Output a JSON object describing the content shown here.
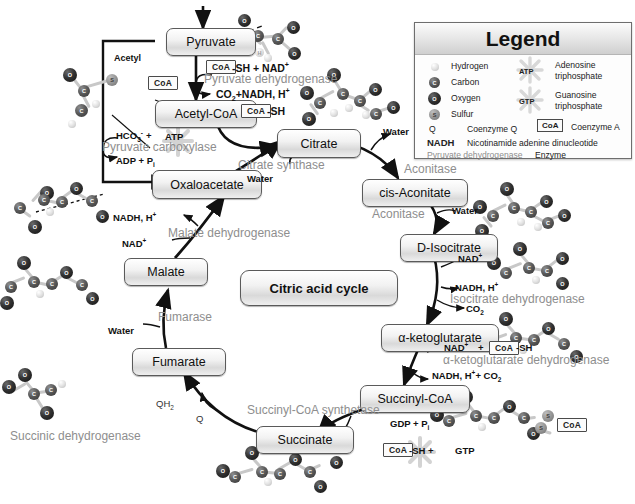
{
  "center_label": "Citric acid cycle",
  "nodes": {
    "pyruvate": "Pyruvate",
    "acetyl_coa": "Acetyl-CoA",
    "oxaloacetate": "Oxaloacetate",
    "citrate": "Citrate",
    "cis_aconitate": "cis-Aconitate",
    "d_isocitrate": "D-Isocitrate",
    "alpha_ketoglutarate": "α-ketoglutarate",
    "succinyl_coa": "Succinyl-CoA",
    "succinate": "Succinate",
    "fumarate": "Fumarate",
    "malate": "Malate"
  },
  "enzymes": {
    "pyruvate_dehydrogenase": "Pyruvate dehydrogenase",
    "pyruvate_carboxylase": "Pyruvate carboxylase",
    "citrate_synthase": "Citrate synthase",
    "aconitase_1": "Aconitase",
    "aconitase_2": "Aconitase",
    "isocitrate_dehydrogenase": "Isocitrate dehydrogenase",
    "akg_dehydrogenase": "α-ketoglutarate dehydrogenase",
    "succinyl_coa_synthetase": "Succinyl-CoA synthetase",
    "succinic_dehydrogenase": "Succinic dehydrogenase",
    "fumarase": "Fumarase",
    "malate_dehydrogenase": "Malate dehydrogenase"
  },
  "cofactors": {
    "coa_label": "CoA",
    "acetyl_label": "Acetyl",
    "pdh_in": "-SH + NAD",
    "pdh_in_sup": "+",
    "pdh_out_pre": "CO",
    "pdh_out_sub": "2",
    "pdh_out_post": "+NADH, H",
    "pdh_out_sup": "+",
    "coa_sh_right": "-SH",
    "pc_hco3_pre": "HCO",
    "pc_hco3_sub": "3",
    "pc_hco3_minus": "-",
    "pc_plus": "+",
    "atp_label": "ATP",
    "pc_out_pre": "ADP + P",
    "pc_out_sub": "i",
    "cs_water": "Water",
    "aconitase_water_1": "Water",
    "aconitase_water_2": "Water",
    "nad_plus_isocitrate": "NAD",
    "nad_plus_isocitrate_sup": "+",
    "nadh_h_isocitrate": "NADH, H",
    "nadh_h_isocitrate_sup": "+",
    "co2_isocitrate_pre": "CO",
    "co2_isocitrate_sub": "2",
    "akg_nad_pre": "NAD",
    "akg_nad_sup": "+",
    "akg_plus": "+",
    "akg_coa_sh": "-SH",
    "akg_out_pre": "NADH, H",
    "akg_out_sup": "+",
    "akg_out_mid": "+ CO",
    "akg_out_sub": "2",
    "gdp_pi_pre": "GDP + P",
    "gdp_pi_sub": "i",
    "scs_coa_sh": "-SH +",
    "gtp_label": "GTP",
    "qh2_pre": "QH",
    "qh2_sub": "2",
    "q_label": "Q",
    "fumarase_water": "Water",
    "mdh_nadh_pre": "NADH, H",
    "mdh_nadh_sup": "+",
    "mdh_nad_pre": "NAD",
    "mdh_nad_sup": "+",
    "coa_free_right": "CoA"
  },
  "legend": {
    "title": "Legend",
    "left_items": [
      {
        "symbol": "H",
        "label": "Hydrogen",
        "kind": "H"
      },
      {
        "symbol": "C",
        "label": "Carbon",
        "kind": "C"
      },
      {
        "symbol": "O",
        "label": "Oxygen",
        "kind": "O"
      },
      {
        "symbol": "S",
        "label": "Sulfur",
        "kind": "S"
      }
    ],
    "coenzyme_q_symbol": "Q",
    "coenzyme_q_label": "Coenzyme Q",
    "nadh_symbol": "NADH",
    "nadh_label": "Nicotinamide adenine dinucleotide",
    "enzyme_example": "Pyruvate dehydrogenase",
    "enzyme_label": "Enzyme",
    "atp_symbol": "ATP",
    "atp_label_1": "Adenosine",
    "atp_label_2": "triphosphate",
    "gtp_symbol": "GTP",
    "gtp_label_1": "Guanosine",
    "gtp_label_2": "triphosphate",
    "coa_symbol": "CoA",
    "coa_label": "Coenzyme A"
  },
  "colors": {
    "carbon": "#4a4a4a",
    "oxygen": "#1e1e1e",
    "hydrogen": "#dcdcdc",
    "sulfur": "#9a9a9a",
    "enzyme_text": "#8e8e8e",
    "node_border": "#5a5a5a",
    "arrow": "#111111"
  }
}
